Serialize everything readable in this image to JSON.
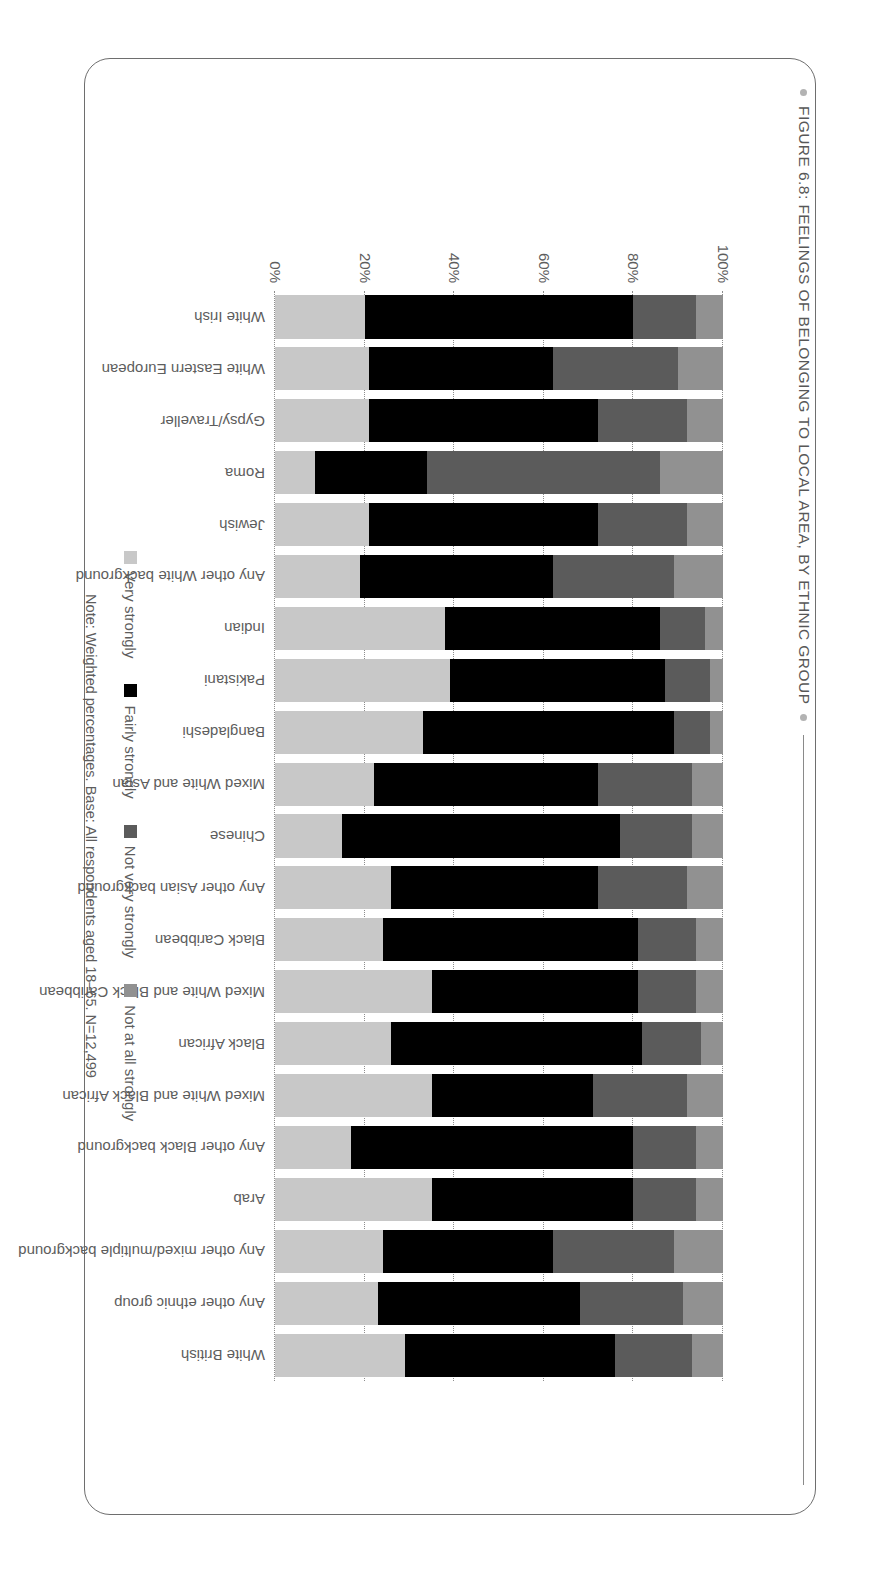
{
  "figure": {
    "title": "FIGURE 6.8: FEELINGS OF BELONGING TO LOCAL AREA, BY ETHNIC GROUP",
    "note": "Note: Weighted percentages. Base: All respondents aged 18–65. N=12,499"
  },
  "colors": {
    "very_strongly": "#c8c8c8",
    "fairly_strongly": "#000000",
    "not_very_strongly": "#5b5b5b",
    "not_at_all_strongly": "#919191",
    "text": "#5d5d5d",
    "frame": "#6e6e6e"
  },
  "legend": {
    "position": "bottom",
    "items": [
      {
        "label": "Very strongly",
        "color": "#c8c8c8"
      },
      {
        "label": "Fairly strongly",
        "color": "#000000"
      },
      {
        "label": "Not very strongly",
        "color": "#5b5b5b"
      },
      {
        "label": "Not at all strongly",
        "color": "#919191"
      }
    ]
  },
  "chart_data": {
    "type": "bar",
    "subtype": "stacked-100-percent",
    "title": "FIGURE 6.8: FEELINGS OF BELONGING TO LOCAL AREA, BY ETHNIC GROUP",
    "xlabel": "",
    "ylabel": "",
    "ylim": [
      0,
      100
    ],
    "grid": true,
    "ticks": [
      "0%",
      "20%",
      "40%",
      "60%",
      "80%",
      "100%"
    ],
    "tick_values": [
      0,
      20,
      40,
      60,
      80,
      100
    ],
    "categories": [
      "White Irish",
      "White Eastern European",
      "Gypsy/Traveller",
      "Roma",
      "Jewish",
      "Any other White background",
      "Indian",
      "Pakistani",
      "Bangladeshi",
      "Mixed White and Asian",
      "Chinese",
      "Any other Asian background",
      "Black Caribbean",
      "Mixed White and Black Caribbean",
      "Black African",
      "Mixed White and Black African",
      "Any other Black background",
      "Arab",
      "Any other mixed/multiple background",
      "Any other ethnic group",
      "White British"
    ],
    "series": [
      {
        "name": "Very strongly",
        "color": "#c8c8c8",
        "values": [
          20,
          21,
          21,
          9,
          21,
          19,
          38,
          39,
          33,
          22,
          15,
          26,
          24,
          35,
          26,
          35,
          17,
          35,
          24,
          23,
          29
        ]
      },
      {
        "name": "Fairly strongly",
        "color": "#000000",
        "values": [
          60,
          41,
          51,
          25,
          51,
          43,
          48,
          48,
          56,
          50,
          62,
          46,
          57,
          46,
          56,
          36,
          63,
          45,
          38,
          45,
          47
        ]
      },
      {
        "name": "Not very strongly",
        "color": "#5b5b5b",
        "values": [
          14,
          28,
          20,
          52,
          20,
          27,
          10,
          10,
          8,
          21,
          16,
          20,
          13,
          13,
          13,
          21,
          14,
          14,
          27,
          23,
          17
        ]
      },
      {
        "name": "Not at all strongly",
        "color": "#919191",
        "values": [
          6,
          10,
          8,
          14,
          8,
          11,
          4,
          3,
          3,
          7,
          7,
          8,
          6,
          6,
          5,
          8,
          6,
          6,
          11,
          9,
          7
        ]
      }
    ]
  }
}
